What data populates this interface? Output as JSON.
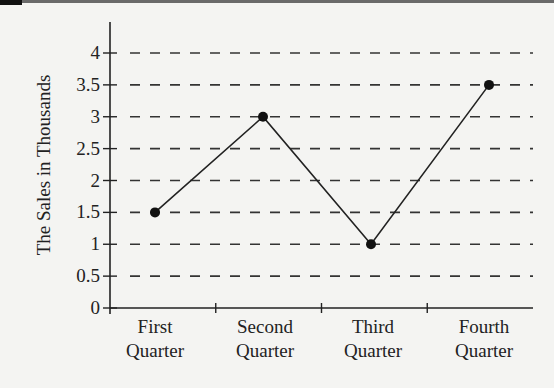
{
  "chart_data": {
    "type": "line",
    "title": "",
    "xlabel": "",
    "ylabel": "The Sales in Thousands",
    "categories": [
      [
        "First",
        "Quarter"
      ],
      [
        "Second",
        "Quarter"
      ],
      [
        "Third",
        "Quarter"
      ],
      [
        "Fourth",
        "Quarter"
      ]
    ],
    "series": [
      {
        "name": "Sales",
        "values": [
          1.5,
          3,
          1,
          3.5
        ]
      }
    ],
    "yticks": [
      "0",
      "0.5",
      "1",
      "1.5",
      "2",
      "2.5",
      "3",
      "3.5",
      "4"
    ],
    "ytick_values": [
      0,
      0.5,
      1,
      1.5,
      2,
      2.5,
      3,
      3.5,
      4
    ],
    "ylim": [
      0,
      4
    ],
    "grid": "horizontal dashed",
    "legend": null
  },
  "colors": {
    "line": "#222222",
    "grid": "#333333",
    "background": "#f4f4f2"
  }
}
